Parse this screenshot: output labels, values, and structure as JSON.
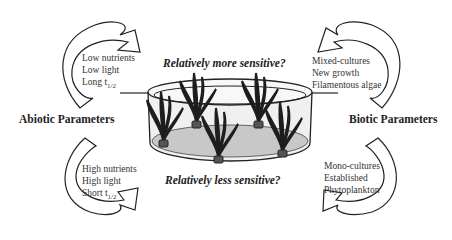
{
  "diagram": {
    "top_question": "Relatively more sensitive?",
    "bottom_question": "Relatively less sensitive?",
    "left": {
      "label": "Abiotic Parameters",
      "upper_items": [
        "Low nutrients",
        "Low light",
        "Long t"
      ],
      "upper_subscript": "1/2",
      "lower_items": [
        "High nutrients",
        "High light",
        "Short t"
      ],
      "lower_subscript": "1/2"
    },
    "right": {
      "label": "Biotic Parameters",
      "upper_items": [
        "Mixed-cultures",
        "New growth",
        "Filamentous algae"
      ],
      "lower_items": [
        "Mono-cultures",
        "Established",
        "Phytoplankton"
      ]
    },
    "colors": {
      "outline": "#222222",
      "tank_floor": "#c8c8c8",
      "tank_wall": "#f0f0f0",
      "plant": "#1e1e1e"
    }
  }
}
